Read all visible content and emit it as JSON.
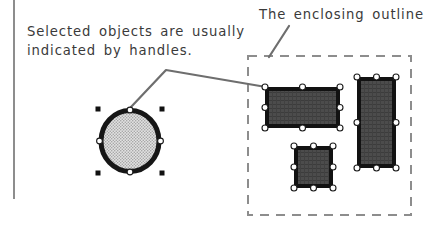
{
  "figure": {
    "background_color": "#ffffff",
    "margin_rule": {
      "name": "page-margin-rule",
      "color": "#8d8d8d",
      "x": 13,
      "y": 0,
      "width": 2,
      "height": 199
    },
    "captions": [
      {
        "id": "selection-handles-caption",
        "lines": [
          "Selected objects are usually",
          "indicated by handles."
        ],
        "text": "Selected objects are usually indicated by handles.",
        "color": "#3a3a3a",
        "x": 27,
        "y": 22
      },
      {
        "id": "enclosing-outline-caption",
        "lines": [
          "The enclosing outline"
        ],
        "text": "The enclosing outline",
        "color": "#3a3a3a",
        "x": 259,
        "y": 5
      }
    ],
    "leader_lines": [
      {
        "id": "handles-leader",
        "color": "#6e6e6e",
        "width": 2,
        "points": [
          [
            131,
            107
          ],
          [
            166,
            70
          ],
          [
            266,
            87
          ]
        ]
      },
      {
        "id": "outline-leader",
        "color": "#6e6e6e",
        "width": 2,
        "points": [
          [
            289,
            26
          ],
          [
            269,
            57
          ]
        ]
      }
    ],
    "shapes": [
      {
        "id": "selected-ellipse",
        "type": "ellipse",
        "cx": 130,
        "cy": 141,
        "rx": 30,
        "ry": 31,
        "fill": "#c9c9c9",
        "fill_pattern": "dotted-screen",
        "stroke": "#161616",
        "stroke_width": 5,
        "handles": {
          "edge_handle_style": "white-circle",
          "corner_handle_style": "black-square",
          "edge_points": [
            [
              130,
              108
            ],
            [
              163,
              141
            ],
            [
              130,
              174
            ],
            [
              97,
              141
            ]
          ],
          "corner_points": [
            [
              98,
              109
            ],
            [
              162,
              109
            ],
            [
              98,
              173
            ],
            [
              162,
              173
            ]
          ]
        }
      },
      {
        "id": "selected-rect-wide",
        "type": "rect",
        "x": 265,
        "y": 87,
        "width": 75,
        "height": 41,
        "fill": "#4a4a4a",
        "fill_pattern": "dark-hatch",
        "stroke": "#121212",
        "stroke_width": 4,
        "handle_style": "white-circle"
      },
      {
        "id": "selected-rect-tall",
        "type": "rect",
        "x": 357,
        "y": 77,
        "width": 39,
        "height": 91,
        "fill": "#4a4a4a",
        "fill_pattern": "dark-hatch",
        "stroke": "#121212",
        "stroke_width": 4,
        "handle_style": "white-circle"
      },
      {
        "id": "selected-rect-small",
        "type": "rect",
        "x": 294,
        "y": 146,
        "width": 39,
        "height": 42,
        "fill": "#4a4a4a",
        "fill_pattern": "dark-hatch",
        "stroke": "#121212",
        "stroke_width": 4,
        "handle_style": "white-circle"
      }
    ],
    "enclosing_outline": {
      "id": "enclosing-outline-box",
      "x": 248,
      "y": 56,
      "width": 163,
      "height": 159,
      "stroke": "#8d8d8d",
      "stroke_width": 2,
      "dash": "9 7",
      "fill": "none"
    },
    "handle_colors": {
      "circle_handle_fill": "#ffffff",
      "circle_handle_stroke": "#1a1a1a",
      "square_handle_fill": "#111111"
    }
  }
}
